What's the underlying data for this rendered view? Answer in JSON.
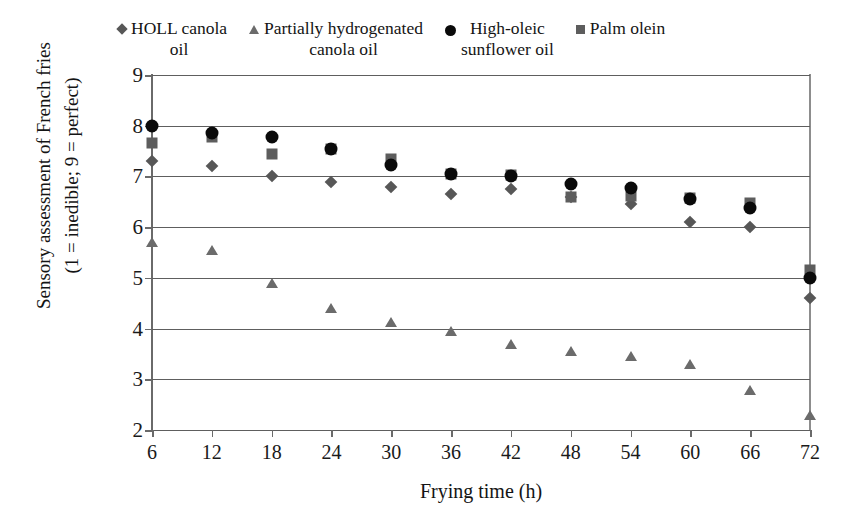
{
  "chart_data": {
    "type": "scatter",
    "title": "",
    "xlabel": "Frying time (h)",
    "ylabel": "Sensory assessment of  French fries\n(1 = inedible; 9 = perfect)",
    "x": [
      6,
      12,
      18,
      24,
      30,
      36,
      42,
      48,
      54,
      60,
      66,
      72
    ],
    "xticklabels": [
      "6",
      "12",
      "18",
      "24",
      "30",
      "36",
      "42",
      "48",
      "54",
      "60",
      "66",
      "72"
    ],
    "yticklabels": [
      "9",
      "8",
      "7",
      "6",
      "5",
      "4",
      "3",
      "2"
    ],
    "ylim": [
      2,
      9
    ],
    "xlim": [
      6,
      72
    ],
    "grid": "horizontal",
    "legend_position": "top",
    "series": [
      {
        "name": "HOLL canola\noil",
        "marker": "diamond",
        "color": "#575757",
        "values": [
          7.3,
          7.2,
          7.0,
          6.9,
          6.8,
          6.65,
          6.75,
          6.6,
          6.45,
          6.1,
          6.0,
          4.6
        ]
      },
      {
        "name": "Partially hydrogenated\ncanola oil",
        "marker": "triangle",
        "color": "#6b6b6b",
        "values": [
          5.7,
          5.55,
          4.9,
          4.4,
          4.12,
          3.95,
          3.7,
          3.55,
          3.45,
          3.3,
          2.78,
          2.3
        ]
      },
      {
        "name": "High-oleic\nsunflower oil",
        "marker": "circle",
        "color": "#0a0a0a",
        "values": [
          8.0,
          7.85,
          7.78,
          7.55,
          7.22,
          7.05,
          7.0,
          6.85,
          6.78,
          6.55,
          6.38,
          5.0
        ]
      },
      {
        "name": "Palm olein",
        "marker": "square",
        "color": "#5d5d5d",
        "values": [
          7.65,
          7.78,
          7.45,
          7.55,
          7.35,
          7.05,
          7.02,
          6.6,
          6.62,
          6.58,
          6.48,
          5.15
        ]
      }
    ]
  }
}
